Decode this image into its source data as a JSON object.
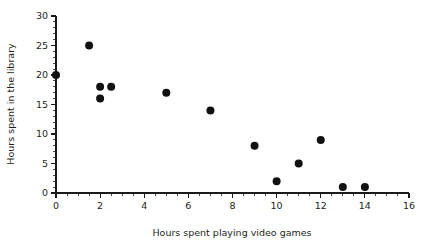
{
  "chart_data": {
    "type": "scatter",
    "title": "",
    "xlabel": "Hours spent playing video games",
    "ylabel": "Hours spent in the library",
    "xlim": [
      0,
      16
    ],
    "ylim": [
      0,
      30
    ],
    "x_major_ticks": [
      0,
      2,
      4,
      6,
      8,
      10,
      12,
      14,
      16
    ],
    "y_major_ticks": [
      0,
      5,
      10,
      15,
      20,
      25,
      30
    ],
    "x_minor_step": 0.5,
    "y_minor_step": 1,
    "grid": false,
    "legend": false,
    "marker": {
      "shape": "circle",
      "color": "#111111",
      "radius": 4.0
    },
    "points": [
      {
        "x": 0,
        "y": 20
      },
      {
        "x": 1.5,
        "y": 25
      },
      {
        "x": 2,
        "y": 18
      },
      {
        "x": 2,
        "y": 16
      },
      {
        "x": 2.5,
        "y": 18
      },
      {
        "x": 5,
        "y": 17
      },
      {
        "x": 7,
        "y": 14
      },
      {
        "x": 9,
        "y": 8
      },
      {
        "x": 10,
        "y": 2
      },
      {
        "x": 11,
        "y": 5
      },
      {
        "x": 12,
        "y": 9
      },
      {
        "x": 13,
        "y": 1
      },
      {
        "x": 14,
        "y": 1
      }
    ]
  },
  "colors": {
    "background": "#ffffff",
    "axis": "#1a1a1a",
    "text": "#231f20",
    "marker": "#111111"
  }
}
